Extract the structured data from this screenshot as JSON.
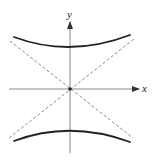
{
  "diagram": {
    "type": "hyperbola-with-asymptotes",
    "axes": {
      "x_label": "x",
      "y_label": "y"
    },
    "colors": {
      "axis": "#8a8a8a",
      "curve": "#222222",
      "asymptote": "#7a7a7a",
      "label": "#222222",
      "background": "#ffffff"
    },
    "elements": [
      {
        "name": "upper-branch",
        "style": "solid",
        "description": "upper branch of hyperbola opening upward"
      },
      {
        "name": "lower-branch",
        "style": "solid",
        "description": "lower branch of hyperbola opening downward"
      },
      {
        "name": "asymptote-positive",
        "style": "dashed",
        "description": "asymptote line with positive slope through origin"
      },
      {
        "name": "asymptote-negative",
        "style": "dashed",
        "description": "asymptote line with negative slope through origin"
      },
      {
        "name": "origin",
        "style": "dot",
        "description": "center point at origin"
      }
    ]
  }
}
